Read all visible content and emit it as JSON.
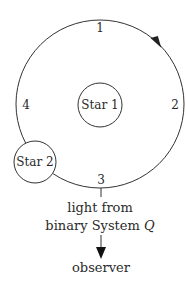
{
  "diagram": {
    "orbit": {
      "cx": 100,
      "cy": 104,
      "r": 84,
      "direction": "clockwise",
      "positions": [
        {
          "label": "1",
          "x": 100,
          "y": 32
        },
        {
          "label": "2",
          "x": 175,
          "y": 109
        },
        {
          "label": "3",
          "x": 101,
          "y": 184
        },
        {
          "label": "4",
          "x": 26,
          "y": 109
        }
      ]
    },
    "star1": {
      "label": "Star 1",
      "cx": 100,
      "cy": 105,
      "r": 22
    },
    "star2": {
      "label": "Star 2",
      "cx": 35,
      "cy": 162,
      "r": 21
    },
    "caption": {
      "line1": "light from",
      "line2_prefix": "binary System ",
      "line2_italic": "Q"
    },
    "observer_label": "observer",
    "colors": {
      "stroke": "#333333",
      "text": "#2a2a2a",
      "background": "#ffffff"
    }
  }
}
